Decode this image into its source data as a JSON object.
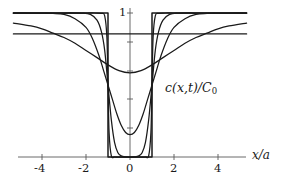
{
  "figure": {
    "kind": "line-plot",
    "background_color": "#ffffff",
    "line_color": "#1a1a1a",
    "y_axis_label_top": "1",
    "x_axis_name": "x/a",
    "curve_label": {
      "full": "c(x,t)/C0",
      "head": "c",
      "args": "(x,t)",
      "slash": "/",
      "cap": "C",
      "sub": "0"
    }
  },
  "chart_data": {
    "type": "line",
    "title": "",
    "subtitle": "",
    "xlabel": "x/a",
    "ylabel": "c(x,t)/C0",
    "annotations": [
      "c(x,t)/C0"
    ],
    "grid": false,
    "legend": "none",
    "xlim": [
      -5.3,
      5.3
    ],
    "ylim": [
      0,
      1.08
    ],
    "xticks": [
      -4,
      -2,
      0,
      2,
      4
    ],
    "xticklabels": [
      "-4",
      "-2",
      "0",
      "2",
      "4"
    ],
    "yticks": [
      1.0,
      0.8,
      0.6,
      0.4,
      0.2,
      0.0
    ],
    "yticklabels": [
      "1",
      "",
      "",
      "",
      "",
      ""
    ],
    "series": [
      {
        "name": "t = 0 (initial rectangular notch)",
        "tau": 0.0,
        "x": [
          -5.3,
          -1.0,
          -1.0,
          1.0,
          1.0,
          5.3
        ],
        "y": [
          1.0,
          1.0,
          0.0,
          0.0,
          1.0,
          1.0
        ]
      },
      {
        "name": "tau = 0.01",
        "tau": 0.01,
        "x": [
          -5.3,
          -4.0,
          -3.0,
          -2.0,
          -1.6,
          -1.3,
          -1.15,
          -1.05,
          -1.0,
          -0.95,
          -0.85,
          -0.7,
          -0.5,
          -0.25,
          0.0,
          0.25,
          0.5,
          0.7,
          0.85,
          0.95,
          1.0,
          1.05,
          1.15,
          1.3,
          1.6,
          2.0,
          3.0,
          4.0,
          5.3
        ],
        "y": [
          1.0,
          1.0,
          1.0,
          1.0,
          1.0,
          0.997,
          0.98,
          0.83,
          0.5,
          0.17,
          0.01,
          0.0,
          0.0,
          0.0,
          0.0,
          0.0,
          0.0,
          0.0,
          0.01,
          0.17,
          0.5,
          0.83,
          0.98,
          0.997,
          1.0,
          1.0,
          1.0,
          1.0,
          1.0
        ]
      },
      {
        "name": "tau = 0.05",
        "tau": 0.05,
        "x": [
          -5.3,
          -4.0,
          -3.0,
          -2.2,
          -1.8,
          -1.5,
          -1.3,
          -1.15,
          -1.0,
          -0.85,
          -0.7,
          -0.55,
          -0.4,
          -0.2,
          0.0,
          0.2,
          0.4,
          0.55,
          0.7,
          0.85,
          1.0,
          1.15,
          1.3,
          1.5,
          1.8,
          2.2,
          3.0,
          4.0,
          5.3
        ],
        "y": [
          1.0,
          1.0,
          1.0,
          0.999,
          0.99,
          0.95,
          0.87,
          0.74,
          0.5,
          0.26,
          0.1,
          0.03,
          0.008,
          0.001,
          0.0,
          0.001,
          0.008,
          0.03,
          0.1,
          0.26,
          0.5,
          0.74,
          0.87,
          0.95,
          0.99,
          0.999,
          1.0,
          1.0,
          1.0
        ]
      },
      {
        "name": "tau = 0.2",
        "tau": 0.2,
        "x": [
          -5.3,
          -4.5,
          -4.0,
          -3.5,
          -3.0,
          -2.5,
          -2.0,
          -1.7,
          -1.4,
          -1.2,
          -1.0,
          -0.8,
          -0.6,
          -0.4,
          -0.2,
          0.0,
          0.2,
          0.4,
          0.6,
          0.8,
          1.0,
          1.2,
          1.4,
          1.7,
          2.0,
          2.5,
          3.0,
          3.5,
          4.0,
          4.5,
          5.3
        ],
        "y": [
          1.0,
          1.0,
          0.999,
          0.997,
          0.99,
          0.96,
          0.9,
          0.82,
          0.7,
          0.6,
          0.5,
          0.4,
          0.3,
          0.22,
          0.17,
          0.155,
          0.17,
          0.22,
          0.3,
          0.4,
          0.5,
          0.6,
          0.7,
          0.82,
          0.9,
          0.96,
          0.99,
          0.997,
          0.999,
          1.0,
          1.0
        ]
      },
      {
        "name": "tau = 1.0",
        "tau": 1.0,
        "x": [
          -5.3,
          -4.5,
          -4.0,
          -3.5,
          -3.0,
          -2.5,
          -2.0,
          -1.5,
          -1.0,
          -0.5,
          0.0,
          0.5,
          1.0,
          1.5,
          2.0,
          2.5,
          3.0,
          3.5,
          4.0,
          4.5,
          5.3
        ],
        "y": [
          0.93,
          0.91,
          0.89,
          0.86,
          0.83,
          0.79,
          0.74,
          0.69,
          0.64,
          0.6,
          0.585,
          0.6,
          0.64,
          0.69,
          0.74,
          0.79,
          0.83,
          0.86,
          0.89,
          0.91,
          0.93
        ]
      },
      {
        "name": "t -> infinity (uniform level)",
        "tau": 1000.0,
        "x": [
          -5.3,
          5.3
        ],
        "y": [
          0.855,
          0.855
        ]
      }
    ]
  }
}
